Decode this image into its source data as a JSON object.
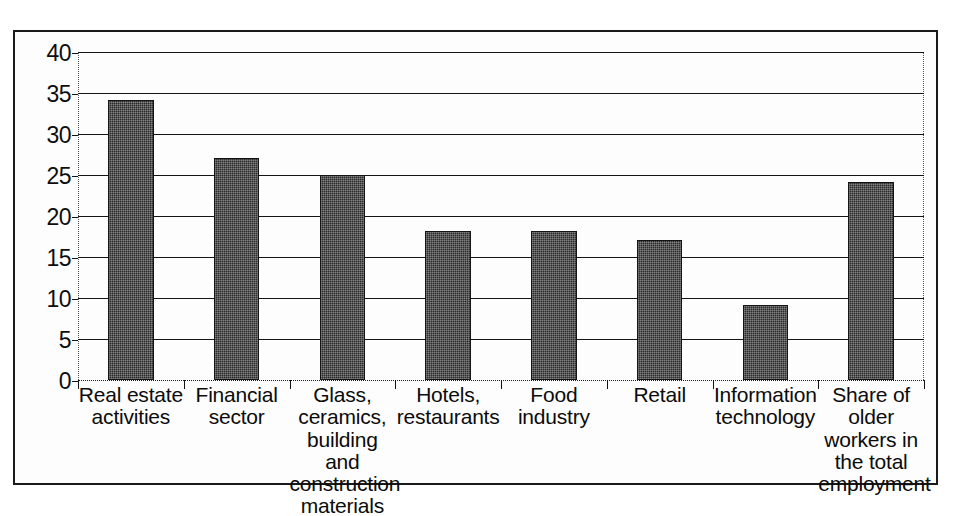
{
  "chart_data": {
    "type": "bar",
    "title": "",
    "subtitle": "",
    "xlabel": "",
    "ylabel": "",
    "ylim": [
      0,
      40
    ],
    "yticks": [
      0,
      5,
      10,
      15,
      20,
      25,
      30,
      35,
      40
    ],
    "ytick_labels": [
      "0",
      "5",
      "10",
      "15",
      "20",
      "25",
      "30",
      "35",
      "40"
    ],
    "grid": true,
    "legend": false,
    "legend_position": "none",
    "bar_color": "#2b2b2b",
    "categories": [
      "Real estate activities",
      "Financial sector",
      "Glass, ceramics, building and construction materials",
      "Hotels, restaurants",
      "Food industry",
      "Retail",
      "Information technology",
      "Share of older workers in the total employment"
    ],
    "category_lines": [
      [
        "Real estate",
        "activities"
      ],
      [
        "Financial",
        "sector"
      ],
      [
        "Glass,",
        "ceramics,",
        "building and",
        "construction",
        "materials"
      ],
      [
        "Hotels,",
        "restaurants"
      ],
      [
        "Food",
        "industry"
      ],
      [
        "Retail"
      ],
      [
        "Information",
        "technology"
      ],
      [
        "Share of",
        "older",
        "workers in",
        "the total",
        "employment"
      ]
    ],
    "values": [
      34.1,
      27.1,
      25.0,
      18.2,
      18.2,
      17.1,
      9.2,
      24.2
    ],
    "series": [
      {
        "name": "Share of older workers",
        "values": [
          34.1,
          27.1,
          25.0,
          18.2,
          18.2,
          17.1,
          9.2,
          24.2
        ]
      }
    ]
  },
  "labels": {
    "cat0_l0": "Real estate",
    "cat0_l1": "activities",
    "cat1_l0": "Financial",
    "cat1_l1": "sector",
    "cat2_l0": "Glass,",
    "cat2_l1": "ceramics,",
    "cat2_l2": "building and",
    "cat2_l3": "construction",
    "cat2_l4": "materials",
    "cat3_l0": "Hotels,",
    "cat3_l1": "restaurants",
    "cat4_l0": "Food",
    "cat4_l1": "industry",
    "cat5_l0": "Retail",
    "cat6_l0": "Information",
    "cat6_l1": "technology",
    "cat7_l0": "Share of",
    "cat7_l1": "older",
    "cat7_l2": "workers in",
    "cat7_l3": "the total",
    "cat7_l4": "employment"
  },
  "yaxis": {
    "t0": "0",
    "t1": "5",
    "t2": "10",
    "t3": "15",
    "t4": "20",
    "t5": "25",
    "t6": "30",
    "t7": "35",
    "t8": "40"
  }
}
